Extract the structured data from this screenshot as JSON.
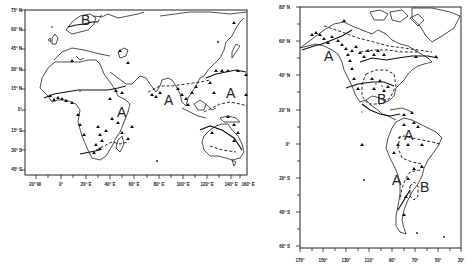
{
  "left_map": {
    "name": "Eastern Hemisphere (Africa, Eurasia, Australia)",
    "lat_ticks": [
      "75° N",
      "60° N",
      "45° N",
      "30° N",
      "15° N",
      "0°",
      "15° S",
      "30° S",
      "45° S"
    ],
    "lon_ticks": [
      "20° W",
      "0°",
      "20° E",
      "40° E",
      "60° E",
      "80° E",
      "100° E",
      "120° E",
      "140° E",
      "160° E"
    ],
    "regions": [
      {
        "label": "B",
        "location": "Scandinavia"
      },
      {
        "label": "A",
        "location": "East Africa"
      },
      {
        "label": "A",
        "location": "South Asia"
      },
      {
        "label": "A",
        "location": "Western Pacific"
      }
    ]
  },
  "right_map": {
    "name": "Western Hemisphere (Americas)",
    "lat_ticks": [
      "80° N",
      "60° N",
      "40° N",
      "20° N",
      "0°",
      "20° S",
      "40° S",
      "60° S"
    ],
    "lon_ticks": [
      "170°",
      "150°",
      "130°",
      "110°",
      "90°",
      "70°",
      "50°",
      "30°"
    ],
    "regions": [
      {
        "label": "A",
        "location": "Northwest North America"
      },
      {
        "label": "B",
        "location": "Gulf of Mexico / Central US"
      },
      {
        "label": "A",
        "location": "Northern South America"
      },
      {
        "label": "A",
        "location": "Western South America"
      },
      {
        "label": "B",
        "location": "Southern Brazil"
      }
    ]
  },
  "legend": {
    "marker": "triangle-station",
    "solid_line": "region boundary",
    "dashed_line": "region boundary (uncertain)"
  }
}
